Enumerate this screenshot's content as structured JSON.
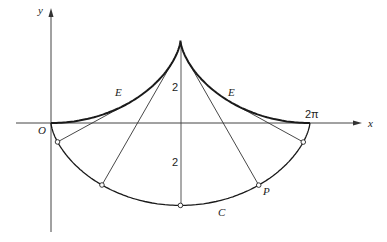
{
  "diagram": {
    "origin_px": [
      51,
      123
    ],
    "scale_px_per_unit": 41.2,
    "radius_a": 1,
    "axes": {
      "x_label": "x",
      "y_label": "y",
      "origin_label": "O",
      "x_tick_label": "2π"
    },
    "curves": {
      "cycloid": {
        "label": "C",
        "equation": "x = t - sin t, y = -(1 - cos t)"
      },
      "evolute": {
        "label": "E",
        "equation": "x = t + sin t, y = 1 - cos t"
      }
    },
    "normal_points_t": [
      1.0,
      2.1,
      3.14159,
      4.18,
      5.28
    ],
    "point_label": "P",
    "height_labels": [
      "2",
      "2"
    ],
    "colors": {
      "curve": "#1a1a1a",
      "line": "#333333",
      "axis": "#444444"
    }
  }
}
